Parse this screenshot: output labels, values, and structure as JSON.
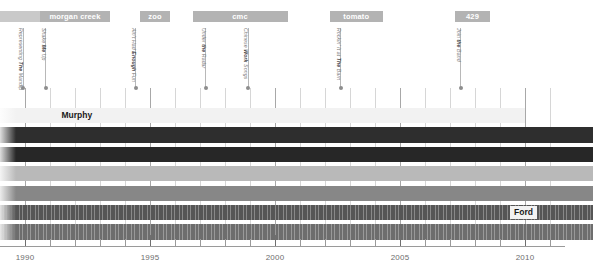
{
  "chart_data": {
    "type": "timeline",
    "title": "",
    "xlabel": "",
    "ylabel": "",
    "xlim": [
      1989.0,
      2011.6
    ],
    "grid": true,
    "axis": {
      "ticks_major": [
        1990,
        1995,
        2000,
        2005,
        2010
      ],
      "tick_labels": [
        "1990",
        "1995",
        "2000",
        "2005",
        "2010"
      ],
      "ticks_minor": [
        1991,
        1992,
        1993,
        1994,
        1996,
        1997,
        1998,
        1999,
        2001,
        2002,
        2003,
        2004,
        2006,
        2007,
        2008,
        2009,
        2011
      ]
    },
    "record_labels": [
      {
        "name": "",
        "start": 1989.0,
        "end": 1990.6,
        "faded": true
      },
      {
        "name": "morgan creek",
        "start": 1990.6,
        "end": 1993.4,
        "faded": false
      },
      {
        "name": "zoo",
        "start": 1994.6,
        "end": 1995.8,
        "faded": false
      },
      {
        "name": "cmc",
        "start": 1996.7,
        "end": 2000.5,
        "faded": false
      },
      {
        "name": "tomato",
        "start": 2002.2,
        "end": 2004.3,
        "faded": false
      },
      {
        "name": "429",
        "start": 2007.2,
        "end": 2008.6,
        "faded": false
      }
    ],
    "releases": [
      {
        "title": "Representing The Mandip",
        "year": 1989.9
      },
      {
        "title": "Shake Me Up",
        "year": 1990.8
      },
      {
        "title": "Ain't Had Enough Fun",
        "year": 1994.4
      },
      {
        "title": "Under the Radar",
        "year": 1997.2
      },
      {
        "title": "Chinese Work Songs",
        "year": 1998.9
      },
      {
        "title": "Rockin' It at The Barn",
        "year": 2002.6
      },
      {
        "title": "Join the Band",
        "year": 2007.4
      }
    ],
    "members": [
      {
        "name": "Murphy",
        "start": 1989.0,
        "end": 2010.0,
        "shade": "#f2f2f2",
        "name_tag": "Murphy",
        "tag_x": 1991.3,
        "hatched": false
      },
      {
        "name": "",
        "start": 1989.0,
        "end": 2012.7,
        "shade": "#2e2e2e",
        "name_tag": "",
        "tag_x": null,
        "hatched": false
      },
      {
        "name": "",
        "start": 1989.0,
        "end": 2012.7,
        "shade": "#272727",
        "name_tag": "",
        "tag_x": null,
        "hatched": false
      },
      {
        "name": "",
        "start": 1989.0,
        "end": 2012.7,
        "shade": "#b9b9b9",
        "name_tag": "",
        "tag_x": null,
        "hatched": false
      },
      {
        "name": "",
        "start": 1989.0,
        "end": 2012.7,
        "shade": "#878787",
        "name_tag": "",
        "tag_x": null,
        "hatched": false
      },
      {
        "name": "Ford",
        "start": 1989.0,
        "end": 2012.7,
        "shade": "#555555",
        "name_tag": "Ford",
        "tag_x": 2009.4,
        "hatched": true
      },
      {
        "name": "",
        "start": 1989.0,
        "end": 2012.7,
        "shade": "#6d6d6d",
        "name_tag": "",
        "tag_x": null,
        "hatched": true
      }
    ],
    "colors": {
      "badge": "#b3b3b3",
      "badge_faded": "#c9c9c9",
      "stem": "#b8b8b8",
      "gridline": "#d6d6d6",
      "axis": "#9a9a9a",
      "text": "#6e6e6e"
    }
  }
}
